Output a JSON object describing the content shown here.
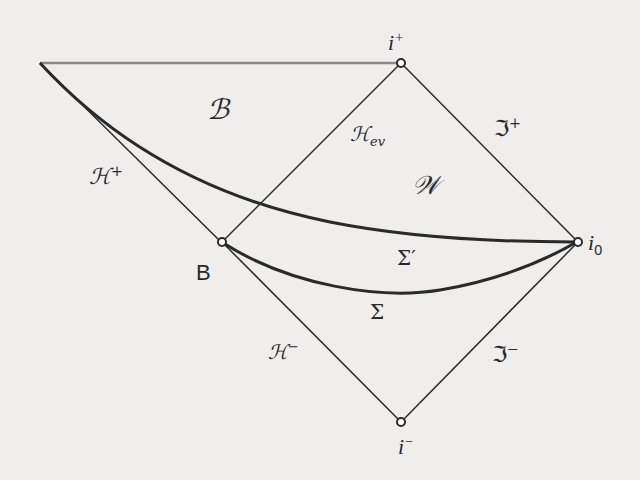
{
  "diagram": {
    "type": "penrose-carter-diagram",
    "points": {
      "corner_top_left": {
        "x": 40,
        "y": 63
      },
      "i_plus": {
        "x": 401,
        "y": 63,
        "label": "i",
        "sup": "+"
      },
      "B": {
        "x": 222,
        "y": 242,
        "label": "B"
      },
      "i_0": {
        "x": 578,
        "y": 242,
        "label": "i",
        "sub": "0"
      },
      "i_minus": {
        "x": 401,
        "y": 422,
        "label": "i",
        "sup": "−"
      }
    },
    "regions": {
      "black_hole": {
        "label": "𝒝",
        "display": "ℬ"
      },
      "exterior": {
        "label": "𝒲",
        "display": "𝒲"
      }
    },
    "labels": {
      "horizon_future": {
        "base": "ℋ",
        "sup": "+"
      },
      "event_horizon": {
        "base": "ℋ",
        "sub": "ev"
      },
      "scri_plus": {
        "base": "ℑ",
        "sup": "+"
      },
      "scri_minus": {
        "base": "ℑ",
        "sup": "−"
      },
      "horizon_past": {
        "base": "ℋ",
        "sup": "−"
      },
      "sigma_prime": "Σ′",
      "sigma": "Σ"
    },
    "colors": {
      "line": "#2a2a2a",
      "top_boundary": "#8a8a8a",
      "background": "#efeeec"
    }
  }
}
